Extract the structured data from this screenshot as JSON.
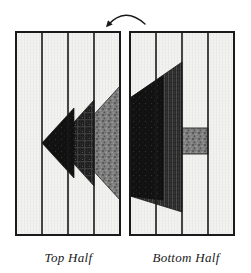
{
  "figure": {
    "kind": "quilt-block-diagram",
    "background_color": "#ffffff",
    "outline_color": "#1a1a1a",
    "fabric_light": "#f0f0f0",
    "fabric_dark": "#141414",
    "fabric_medium_dark": "#3a3a3a",
    "fabric_gray_speckle": "#808080",
    "rotation_arrow": {
      "name": "rotation-arrow",
      "description": "curved arrow indicating the bottom half is flipped",
      "arrowhead_side": "left"
    }
  },
  "panels": [
    {
      "id": "top-half",
      "label": "Top Half",
      "x": 16,
      "y": 32,
      "width": 104,
      "height": 203,
      "strips": [
        {
          "index": 0,
          "x": 16,
          "width": 26,
          "fabric": "light"
        },
        {
          "index": 1,
          "x": 42,
          "width": 26,
          "fabric": "light"
        },
        {
          "index": 2,
          "x": 68,
          "width": 26,
          "fabric": "light"
        },
        {
          "index": 3,
          "x": 94,
          "width": 26,
          "fabric": "light"
        }
      ],
      "motif": "left-pointing chevron made of three nested triangles: dark solid, dark plaid, gray speckle",
      "motif_tip_x": 42,
      "motif_tip_y": 143
    },
    {
      "id": "bottom-half",
      "label": "Bottom Half",
      "x": 130,
      "y": 32,
      "width": 104,
      "height": 203,
      "strips": [
        {
          "index": 0,
          "x": 130,
          "width": 26,
          "fabric": "light"
        },
        {
          "index": 1,
          "x": 156,
          "width": 26,
          "fabric": "light"
        },
        {
          "index": 2,
          "x": 182,
          "width": 26,
          "fabric": "light"
        },
        {
          "index": 3,
          "x": 208,
          "width": 26,
          "fabric": "light"
        }
      ],
      "motif": "wide slanted dark wedge spanning strips 1-2 with vertical-stripe fabric, plus a small gray speckled rectangle in strip 3",
      "accent_block": {
        "x": 182,
        "y": 128,
        "width": 26,
        "height": 26,
        "fabric": "gray-speckle"
      }
    }
  ],
  "labels": {
    "top": "Top Half",
    "bottom": "Bottom Half"
  }
}
